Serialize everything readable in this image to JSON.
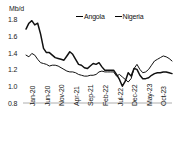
{
  "chart_data": {
    "type": "line",
    "title": "",
    "subtitle": "",
    "unit_label": "Mb/d",
    "xlabel": "",
    "ylabel": "Mb/d",
    "ylim": [
      0.8,
      1.8
    ],
    "y_ticks": [
      "0.8",
      "1.0",
      "1.2",
      "1.4",
      "1.6",
      "1.8"
    ],
    "y_tick_values": [
      0.8,
      1.0,
      1.2,
      1.4,
      1.6,
      1.8
    ],
    "grid": false,
    "legend_position": "top-center",
    "x_tick_labels": [
      "Jan-20",
      "Jun-20",
      "Nov-20",
      "Apr-21",
      "Sep-21",
      "Feb-22",
      "Jul-22",
      "Dec-22",
      "May-23",
      "Oct-23",
      "Mar-24"
    ],
    "x_tick_indices": [
      0,
      5,
      10,
      15,
      20,
      25,
      30,
      35,
      40,
      45,
      50
    ],
    "x": [
      "Jan-20",
      "Feb-20",
      "Mar-20",
      "Apr-20",
      "May-20",
      "Jun-20",
      "Jul-20",
      "Aug-20",
      "Sep-20",
      "Oct-20",
      "Nov-20",
      "Dec-20",
      "Jan-21",
      "Feb-21",
      "Mar-21",
      "Apr-21",
      "May-21",
      "Jun-21",
      "Jul-21",
      "Aug-21",
      "Sep-21",
      "Oct-21",
      "Nov-21",
      "Dec-21",
      "Jan-22",
      "Feb-22",
      "Mar-22",
      "Apr-22",
      "May-22",
      "Jun-22",
      "Jul-22",
      "Aug-22",
      "Sep-22",
      "Oct-22",
      "Nov-22",
      "Dec-22",
      "Jan-23",
      "Feb-23",
      "Mar-23",
      "Apr-23",
      "May-23",
      "Jun-23",
      "Jul-23",
      "Aug-23",
      "Sep-23",
      "Oct-23",
      "Nov-23",
      "Dec-23",
      "Jan-24",
      "Feb-24",
      "Mar-24"
    ],
    "series": [
      {
        "name": "Angola",
        "color": "#111111",
        "line_width": 1.5,
        "values": [
          1.68,
          1.75,
          1.78,
          1.73,
          1.75,
          1.62,
          1.45,
          1.4,
          1.4,
          1.37,
          1.34,
          1.33,
          1.32,
          1.31,
          1.36,
          1.41,
          1.38,
          1.32,
          1.26,
          1.25,
          1.22,
          1.21,
          1.24,
          1.27,
          1.26,
          1.28,
          1.23,
          1.19,
          1.19,
          1.19,
          1.19,
          1.14,
          1.08,
          1.0,
          1.06,
          1.16,
          1.12,
          1.21,
          1.2,
          1.13,
          1.09,
          1.09,
          1.1,
          1.13,
          1.15,
          1.16,
          1.16,
          1.17,
          1.17,
          1.16,
          1.15
        ]
      },
      {
        "name": "Nigeria",
        "color": "#111111",
        "line_width": 1.0,
        "values": [
          1.37,
          1.35,
          1.39,
          1.37,
          1.32,
          1.28,
          1.27,
          1.26,
          1.24,
          1.25,
          1.25,
          1.24,
          1.22,
          1.2,
          1.18,
          1.17,
          1.17,
          1.16,
          1.14,
          1.13,
          1.12,
          1.12,
          1.13,
          1.13,
          1.14,
          1.17,
          1.18,
          1.17,
          1.17,
          1.17,
          1.17,
          1.12,
          1.14,
          1.11,
          1.08,
          1.05,
          1.09,
          1.21,
          1.26,
          1.2,
          1.16,
          1.17,
          1.2,
          1.25,
          1.3,
          1.32,
          1.34,
          1.36,
          1.35,
          1.33,
          1.3
        ]
      }
    ]
  },
  "legend": {
    "items": [
      {
        "label": "Angola",
        "swatch": "line-swatch-thick"
      },
      {
        "label": "Nigeria",
        "swatch": "line-swatch-thin"
      }
    ]
  }
}
